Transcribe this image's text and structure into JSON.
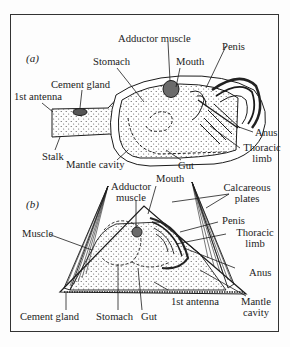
{
  "figure": {
    "panels": [
      {
        "id": "a",
        "tag": "(a)",
        "labels": {
          "adductor_muscle": "Adductor muscle",
          "stomach": "Stomach",
          "mouth": "Mouth",
          "penis": "Penis",
          "cement_gland": "Cement gland",
          "first_antenna": "1st antenna",
          "anus": "Anus",
          "thoracic_limb_1": "Thoracic",
          "thoracic_limb_2": "limb",
          "stalk": "Stalk",
          "mantle_cavity": "Mantle cavity",
          "gut": "Gut"
        }
      },
      {
        "id": "b",
        "tag": "(b)",
        "labels": {
          "mouth": "Mouth",
          "adductor_muscle_1": "Adductor",
          "adductor_muscle_2": "muscle",
          "calcareous_plates_1": "Calcareous",
          "calcareous_plates_2": "plates",
          "muscle": "Muscle",
          "penis": "Penis",
          "thoracic_limb_1": "Thoracic",
          "thoracic_limb_2": "limb",
          "anus": "Anus",
          "first_antenna": "1st antenna",
          "mantle_cavity_1": "Mantle",
          "mantle_cavity_2": "cavity",
          "cement_gland": "Cement gland",
          "stomach": "Stomach",
          "gut": "Gut"
        }
      }
    ],
    "colors": {
      "ink": "#1c1c1c",
      "frame": "#333333",
      "adductor_fill": "#6b6b6b",
      "background": "#fdfdfd"
    }
  }
}
